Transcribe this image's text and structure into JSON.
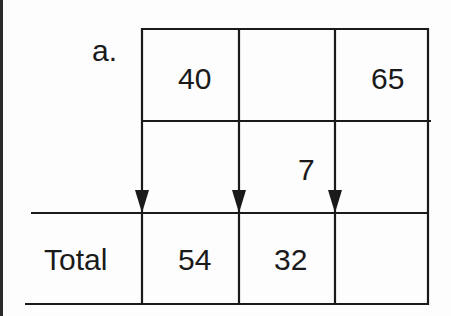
{
  "diagram": {
    "label": "a.",
    "row_label_total": "Total",
    "cells": {
      "r1c1": "40",
      "r1c2": "",
      "r1c3": "65",
      "r2c1": "",
      "r2c2": "7",
      "r2c3": "",
      "total_c1": "54",
      "total_c2": "32",
      "total_c3": ""
    },
    "arrows": [
      {
        "column": 1,
        "direction": "down"
      },
      {
        "column": 2,
        "direction": "down"
      },
      {
        "column": 3,
        "direction": "down"
      }
    ],
    "line_color": "#1a1a1a"
  }
}
